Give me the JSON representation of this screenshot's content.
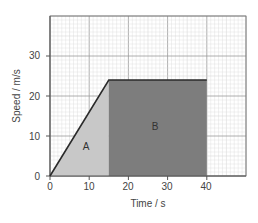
{
  "chart_data": {
    "type": "area",
    "title": "",
    "xlabel": "Time / s",
    "ylabel": "Speed / m/s",
    "xlim": [
      0,
      50
    ],
    "ylim": [
      0,
      40
    ],
    "x_ticks": [
      0,
      10,
      20,
      30,
      40
    ],
    "y_ticks": [
      0,
      10,
      20,
      30
    ],
    "grid": true,
    "series": [
      {
        "name": "speed",
        "x": [
          0,
          15,
          40
        ],
        "y": [
          0,
          24,
          24
        ]
      }
    ],
    "regions": [
      {
        "label": "A",
        "shape": "triangle",
        "x_range": [
          0,
          15
        ],
        "color": "#c8c8c8"
      },
      {
        "label": "B",
        "shape": "rectangle",
        "x_range": [
          15,
          40
        ],
        "color": "#7d7d7d"
      }
    ],
    "legend": null
  },
  "labels": {
    "xlabel": "Time / s",
    "ylabel": "Speed / m/s",
    "region_a": "A",
    "region_b": "B",
    "xtick_0": "0",
    "xtick_10": "10",
    "xtick_20": "20",
    "xtick_30": "30",
    "xtick_40": "40",
    "ytick_0": "0",
    "ytick_10": "10",
    "ytick_20": "20",
    "ytick_30": "30"
  },
  "colors": {
    "grid_minor": "#d9d9d9",
    "grid_major": "#9a9a9a",
    "region_a": "#c8c8c8",
    "region_b": "#7d7d7d",
    "line": "#2a2a2a"
  }
}
